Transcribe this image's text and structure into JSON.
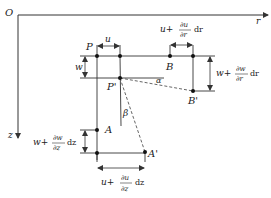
{
  "diagram": {
    "axes": {
      "origin_label": "O",
      "horizontal_label": "r",
      "vertical_label": "z"
    },
    "points": {
      "P": "P",
      "P_prime": "P'",
      "B": "B",
      "B_prime": "B'",
      "A": "A",
      "A_prime": "A'"
    },
    "angles": {
      "alpha": "α",
      "beta": "β"
    },
    "dimensions": {
      "u": "u",
      "w": "w",
      "u_plus_dr": {
        "prefix": "u+",
        "num": "∂u",
        "den": "∂r",
        "suffix": "dr"
      },
      "w_plus_dr": {
        "prefix": "w+",
        "num": "∂w",
        "den": "∂r",
        "suffix": "dr"
      },
      "w_plus_dz": {
        "prefix": "w+",
        "num": "∂w",
        "den": "∂z",
        "suffix": "dz"
      },
      "u_plus_dz": {
        "prefix": "u+",
        "num": "∂u",
        "den": "∂z",
        "suffix": "dz"
      }
    },
    "colors": {
      "line": "#333333",
      "dashed": "#555555"
    }
  }
}
